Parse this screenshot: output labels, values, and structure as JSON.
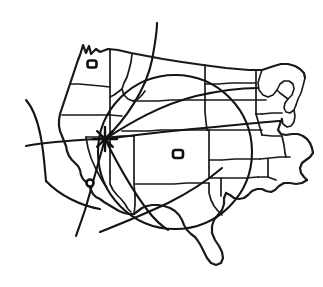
{
  "figure": {
    "kind": "hand-drawn-map",
    "title": "Sketch map of the western and central United States",
    "background_color": "#ffffff",
    "ink_color": "#1a1a1a",
    "width": 323,
    "height": 287,
    "has_labels": false,
    "has_legend": false,
    "has_axes": false,
    "has_text": false
  },
  "map": {
    "region_label": "western-and-central-united-states",
    "style": "freehand pen sketch, black ink on white",
    "outline_name": "national-coastline-and-border",
    "state_grid_name": "state-boundary-lines",
    "great_lakes_name": "great-lakes-outline"
  },
  "markers": [
    {
      "id": "marker-northwest",
      "name": "city-marker-northwest",
      "shape": "small-rounded-rectangle",
      "x": 92,
      "y": 64,
      "w": 9,
      "h": 7
    },
    {
      "id": "marker-southwest",
      "name": "city-marker-southwest",
      "shape": "small-circle",
      "x": 90,
      "y": 183,
      "w": 7,
      "h": 7
    },
    {
      "id": "marker-central",
      "name": "city-marker-central",
      "shape": "small-rounded-rectangle",
      "x": 178,
      "y": 154,
      "w": 10,
      "h": 8
    }
  ],
  "hub": {
    "name": "hub-star-marker",
    "x": 105,
    "y": 139,
    "ray_count": 8,
    "description": "star-burst node where all route lines converge"
  },
  "radius_circle": {
    "name": "coverage-radius-circle",
    "center_x": 175,
    "center_y": 152,
    "radius": 77
  },
  "secondary_arc": {
    "name": "secondary-coverage-arc",
    "center_x": 112,
    "center_y": 140,
    "radius": 87
  },
  "routes": [
    {
      "name": "route-line-north",
      "from": "hub",
      "to": "top-edge"
    },
    {
      "name": "route-line-west",
      "from": "hub",
      "to": "left-edge"
    },
    {
      "name": "route-line-southwest",
      "from": "hub",
      "to": "bottom-left"
    },
    {
      "name": "route-line-southeast",
      "from": "hub",
      "to": "bottom-center"
    },
    {
      "name": "route-line-east",
      "from": "hub",
      "to": "right-edge"
    },
    {
      "name": "route-line-northeast",
      "from": "hub",
      "to": "upper-right"
    }
  ]
}
